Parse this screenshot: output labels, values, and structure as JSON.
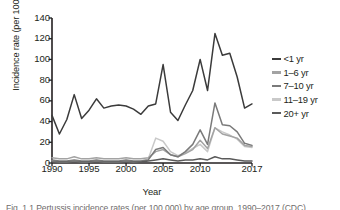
{
  "figure": {
    "xlabel": "Year",
    "ylabel": "Incidence rate (per 100,000)",
    "caption": "Fig. 1.1  Pertussis incidence rates (per 100,000) by age group, 1990–2017 (CDC)"
  },
  "axes": {
    "y_ticks": [
      "0",
      "20",
      "40",
      "60",
      "80",
      "100",
      "120",
      "140"
    ],
    "x_ticks": [
      "1990",
      "1995",
      "2000",
      "2005",
      "2010",
      "2017"
    ]
  },
  "legend": {
    "position": "right",
    "items": [
      {
        "label": "<1 yr",
        "color": "#3b3b3b"
      },
      {
        "label": "1–6 yr",
        "color": "#a3a3a3"
      },
      {
        "label": "7–10 yr",
        "color": "#7a7a7a"
      },
      {
        "label": "11–19 yr",
        "color": "#c9c9c9"
      },
      {
        "label": "20+ yr",
        "color": "#5a5a5a"
      }
    ]
  },
  "chart_data": {
    "type": "line",
    "title": "",
    "subtitle": "",
    "xlabel": "Year",
    "ylabel": "Incidence rate (per 100,000)",
    "xlim": [
      1990,
      2017
    ],
    "ylim": [
      0,
      140
    ],
    "grid": false,
    "legend_position": "right",
    "x": [
      1990,
      1991,
      1992,
      1993,
      1994,
      1995,
      1996,
      1997,
      1998,
      1999,
      2000,
      2001,
      2002,
      2003,
      2004,
      2005,
      2006,
      2007,
      2008,
      2009,
      2010,
      2011,
      2012,
      2013,
      2014,
      2015,
      2016,
      2017
    ],
    "series": [
      {
        "name": "<1 yr",
        "color": "#3b3b3b",
        "values": [
          46,
          28,
          42,
          66,
          43,
          51,
          62,
          53,
          55,
          56,
          55,
          52,
          47,
          55,
          57,
          95,
          49,
          41,
          56,
          70,
          100,
          70,
          125,
          104,
          106,
          83,
          53,
          57
        ]
      },
      {
        "name": "1–6 yr",
        "color": "#a3a3a3",
        "values": [
          5,
          4,
          4,
          6,
          4,
          4,
          5,
          4,
          4,
          4,
          5,
          4,
          4,
          5,
          11,
          13,
          8,
          6,
          9,
          13,
          22,
          14,
          34,
          28,
          26,
          24,
          17,
          16
        ]
      },
      {
        "name": "7–10 yr",
        "color": "#7a7a7a",
        "values": [
          3,
          2,
          2,
          3,
          2,
          2,
          3,
          2,
          2,
          2,
          3,
          2,
          2,
          3,
          13,
          15,
          8,
          6,
          11,
          18,
          32,
          18,
          58,
          37,
          36,
          30,
          19,
          17
        ]
      },
      {
        "name": "11–19 yr",
        "color": "#c9c9c9",
        "values": [
          2,
          1,
          1,
          2,
          1,
          1,
          2,
          1,
          1,
          1,
          2,
          1,
          2,
          4,
          24,
          21,
          11,
          7,
          10,
          14,
          18,
          11,
          34,
          30,
          27,
          23,
          16,
          15
        ]
      },
      {
        "name": "20+ yr",
        "color": "#5a5a5a",
        "values": [
          1,
          1,
          1,
          1,
          1,
          1,
          1,
          1,
          1,
          1,
          1,
          1,
          1,
          2,
          3,
          4,
          3,
          2,
          3,
          3,
          4,
          3,
          6,
          4,
          4,
          3,
          2,
          2
        ]
      }
    ]
  }
}
